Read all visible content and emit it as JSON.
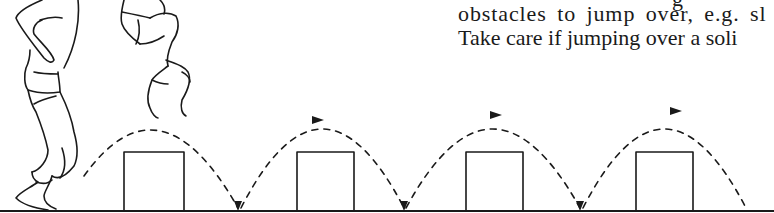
{
  "text": {
    "partial_line_above": "g",
    "line1": "obstacles to jump over, e.g. sl",
    "line2": "Take care if jumping over a soli"
  },
  "illustration": {
    "description": "Figures jumping over a row of box obstacles with dashed arc trajectories",
    "figures": [
      "standing-figure",
      "jumping-figure"
    ],
    "obstacles_count": 4,
    "arcs_count": 4,
    "colors": {
      "ink": "#1a1a1a",
      "background": "#ffffff"
    }
  }
}
